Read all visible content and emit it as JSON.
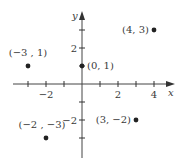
{
  "chart_data": {
    "type": "scatter",
    "title": "",
    "xlabel": "x",
    "ylabel": "y",
    "xlim": [
      -4,
      5
    ],
    "ylim": [
      -4,
      4
    ],
    "grid": false,
    "x_ticks": [
      -3,
      -2,
      -1,
      1,
      2,
      3,
      4
    ],
    "x_tick_labels": [
      {
        "value": -2,
        "label": "−2"
      },
      {
        "value": 2,
        "label": "2"
      },
      {
        "value": 4,
        "label": "4"
      }
    ],
    "y_ticks": [
      -3,
      -2,
      -1,
      1,
      2,
      3
    ],
    "y_tick_labels": [
      {
        "value": 2,
        "label": "2"
      },
      {
        "value": -2,
        "label": "−2"
      }
    ],
    "points": [
      {
        "x": 4,
        "y": 3,
        "label": "(4, 3)"
      },
      {
        "x": -3,
        "y": 1,
        "label": "(−3 , 1)"
      },
      {
        "x": 0,
        "y": 1,
        "label": "(0, 1)"
      },
      {
        "x": -2,
        "y": -3,
        "label": "(−2 , −3)"
      },
      {
        "x": 3,
        "y": -2,
        "label": "(3, −2)"
      }
    ]
  },
  "axes": {
    "x_name": "x",
    "y_name": "y"
  }
}
